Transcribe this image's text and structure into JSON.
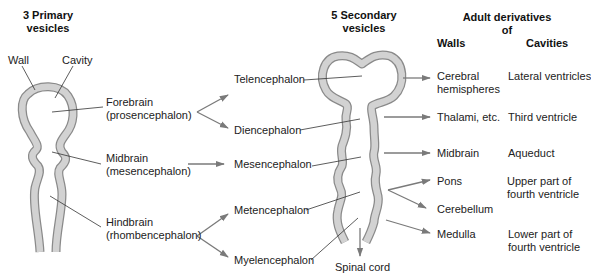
{
  "headers": {
    "primary": [
      "3 Primary",
      "vesicles"
    ],
    "secondary": [
      "5 Secondary",
      "vesicles"
    ],
    "adult": [
      "Adult derivatives",
      "of"
    ],
    "walls": "Walls",
    "cavities": "Cavities"
  },
  "primary_labels": {
    "wall": "Wall",
    "cavity": "Cavity",
    "forebrain": [
      "Forebrain",
      "(prosencephalon)"
    ],
    "midbrain": [
      "Midbrain",
      "(mesencephalon)"
    ],
    "hindbrain": [
      "Hindbrain",
      "(rhombencephalon)"
    ]
  },
  "secondary_labels": {
    "telencephalon": "Telencephalon",
    "diencephalon": "Diencephalon",
    "mesencephalon": "Mesencephalon",
    "metencephalon": "Metencephalon",
    "myelencephalon": "Myelencephalon",
    "spinal_cord": "Spinal cord"
  },
  "walls": {
    "cerebral": [
      "Cerebral",
      "hemispheres"
    ],
    "thalami": "Thalami, etc.",
    "midbrain": "Midbrain",
    "pons": "Pons",
    "cerebellum": "Cerebellum",
    "medulla": "Medulla"
  },
  "cavities": {
    "lateral": "Lateral ventricles",
    "third": "Third ventricle",
    "aqueduct": "Aqueduct",
    "upper_fourth": [
      "Upper part of",
      "fourth ventricle"
    ],
    "lower_fourth": [
      "Lower part of",
      "fourth ventricle"
    ]
  },
  "colors": {
    "wall_fill": "#cfcfcf",
    "wall_stroke": "#8a8a8a",
    "arrow": "#7a7a7a",
    "leader": "#333333"
  }
}
